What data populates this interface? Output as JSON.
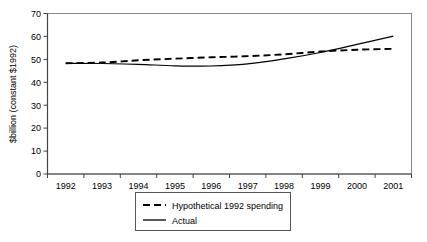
{
  "figure": {
    "clipped_header_text": "",
    "background_color": "#ffffff",
    "frame_color": "#808080",
    "series_color": "#000000"
  },
  "chart_data": {
    "type": "line",
    "title": "",
    "xlabel": "",
    "ylabel": "$billion (constant $1992)",
    "categories": [
      "1992",
      "1993",
      "1994",
      "1995",
      "1996",
      "1997",
      "1998",
      "1999",
      "2000",
      "2001"
    ],
    "x": [
      1992,
      1993,
      1994,
      1995,
      1996,
      1997,
      1998,
      1999,
      2000,
      2001
    ],
    "ylim": [
      0,
      70
    ],
    "yticks": [
      0,
      10,
      20,
      30,
      40,
      50,
      60,
      70
    ],
    "ytick_labels": [
      "0",
      "10",
      "20",
      "30",
      "40",
      "50",
      "60",
      "70"
    ],
    "grid": false,
    "legend_position": "bottom-center",
    "series": [
      {
        "name": "Hypothetical 1992 spending",
        "style": "dashed",
        "values": [
          48.3,
          48.6,
          49.6,
          50.3,
          50.9,
          51.4,
          52.2,
          53.4,
          54.2,
          54.6
        ]
      },
      {
        "name": "Actual",
        "style": "solid",
        "values": [
          48.3,
          48.2,
          47.8,
          47.2,
          47.1,
          48.0,
          50.2,
          53.0,
          56.5,
          60.1
        ]
      }
    ]
  },
  "y_axis": {
    "title": "$billion (constant $1992)",
    "ticks": [
      "70",
      "60",
      "50",
      "40",
      "30",
      "20",
      "10",
      "0"
    ]
  },
  "x_axis": {
    "ticks": [
      "1992",
      "1993",
      "1994",
      "1995",
      "1996",
      "1997",
      "1998",
      "1999",
      "2000",
      "2001"
    ]
  },
  "legend": {
    "items": [
      {
        "label": "Hypothetical 1992 spending",
        "style": "dashed"
      },
      {
        "label": "Actual",
        "style": "solid"
      }
    ]
  }
}
